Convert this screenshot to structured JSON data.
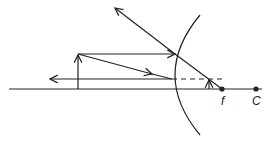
{
  "diagram": {
    "type": "convex-mirror-ray-diagram",
    "labels": {
      "focal_point": "f",
      "center_of_curvature": "C"
    },
    "colors": {
      "stroke": "#222222",
      "background": "#ffffff"
    }
  }
}
